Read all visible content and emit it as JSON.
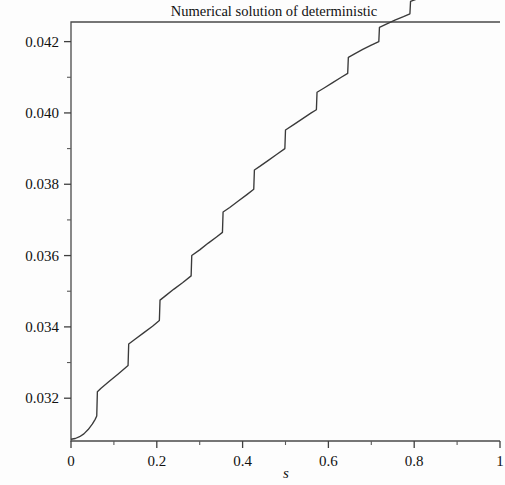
{
  "chart_data": {
    "type": "line",
    "title": "Numerical solution of deterministic",
    "xlabel": "s",
    "ylabel": "",
    "xlim": [
      0,
      1
    ],
    "ylim": [
      0.0308,
      0.04255
    ],
    "grid": false,
    "legend": null,
    "x_ticks": [
      {
        "value": 0,
        "label": "0"
      },
      {
        "value": 0.2,
        "label": "0.2"
      },
      {
        "value": 0.4,
        "label": "0.4"
      },
      {
        "value": 0.6,
        "label": "0.6"
      },
      {
        "value": 0.8,
        "label": "0.8"
      },
      {
        "value": 1,
        "label": "1"
      }
    ],
    "x_minor_ticks": [
      0.1,
      0.3,
      0.5,
      0.7,
      0.9
    ],
    "y_ticks": [
      {
        "value": 0.032,
        "label": "0.032"
      },
      {
        "value": 0.034,
        "label": "0.034"
      },
      {
        "value": 0.036,
        "label": "0.036"
      },
      {
        "value": 0.038,
        "label": "0.038"
      },
      {
        "value": 0.04,
        "label": "0.040"
      },
      {
        "value": 0.042,
        "label": "0.042"
      }
    ],
    "y_minor_ticks": [
      0.033,
      0.035,
      0.037,
      0.039,
      0.041
    ],
    "series": [
      {
        "name": "deterministic numerical solution",
        "description": "monotone increasing staircase: smooth concave rise then 13 vertical jumps with sloped risers, flattening near s=1",
        "points": [
          [
            0.0,
            0.03085
          ],
          [
            0.01,
            0.03087
          ],
          [
            0.02,
            0.03092
          ],
          [
            0.03,
            0.031
          ],
          [
            0.04,
            0.03112
          ],
          [
            0.05,
            0.03128
          ],
          [
            0.056,
            0.0314
          ],
          [
            0.06,
            0.0315
          ],
          [
            0.0615,
            0.03218
          ],
          [
            0.07,
            0.03228
          ],
          [
            0.09,
            0.03248
          ],
          [
            0.11,
            0.03268
          ],
          [
            0.133,
            0.03292
          ],
          [
            0.1345,
            0.03352
          ],
          [
            0.15,
            0.03366
          ],
          [
            0.17,
            0.03384
          ],
          [
            0.19,
            0.03402
          ],
          [
            0.206,
            0.03418
          ],
          [
            0.2075,
            0.03475
          ],
          [
            0.22,
            0.03487
          ],
          [
            0.24,
            0.03506
          ],
          [
            0.26,
            0.03524
          ],
          [
            0.28,
            0.03543
          ],
          [
            0.2815,
            0.036
          ],
          [
            0.3,
            0.03616
          ],
          [
            0.32,
            0.03635
          ],
          [
            0.34,
            0.03653
          ],
          [
            0.353,
            0.03665
          ],
          [
            0.3545,
            0.03722
          ],
          [
            0.37,
            0.03735
          ],
          [
            0.39,
            0.03753
          ],
          [
            0.41,
            0.03771
          ],
          [
            0.426,
            0.03786
          ],
          [
            0.4275,
            0.0384
          ],
          [
            0.44,
            0.0385
          ],
          [
            0.46,
            0.03867
          ],
          [
            0.48,
            0.03884
          ],
          [
            0.4985,
            0.039
          ],
          [
            0.5,
            0.03952
          ],
          [
            0.52,
            0.03968
          ],
          [
            0.54,
            0.03984
          ],
          [
            0.56,
            0.04
          ],
          [
            0.572,
            0.04009
          ],
          [
            0.5735,
            0.04058
          ],
          [
            0.59,
            0.0407
          ],
          [
            0.61,
            0.04085
          ],
          [
            0.63,
            0.041
          ],
          [
            0.645,
            0.04111
          ],
          [
            0.6465,
            0.04156
          ],
          [
            0.66,
            0.04165
          ],
          [
            0.68,
            0.04178
          ],
          [
            0.7,
            0.0419
          ],
          [
            0.7175,
            0.042
          ],
          [
            0.719,
            0.0424
          ],
          [
            0.735,
            0.04249
          ],
          [
            0.755,
            0.0426
          ],
          [
            0.775,
            0.0427
          ],
          [
            0.79,
            0.04278
          ],
          [
            0.7915,
            0.04313
          ],
          [
            0.81,
            0.04321
          ],
          [
            0.83,
            0.0433
          ],
          [
            0.85,
            0.04339
          ],
          [
            0.863,
            0.04344
          ],
          [
            0.8645,
            0.04374
          ],
          [
            0.88,
            0.0438
          ],
          [
            0.9,
            0.04387
          ],
          [
            0.92,
            0.04394
          ],
          [
            0.935,
            0.04398
          ],
          [
            0.9365,
            0.0442
          ],
          [
            0.95,
            0.04424
          ],
          [
            0.97,
            0.04429
          ],
          [
            0.99,
            0.04433
          ],
          [
            1.0,
            0.04435
          ]
        ]
      }
    ]
  },
  "figure": {
    "plot_left_px": 71,
    "plot_right_px": 500,
    "plot_top_px": 22,
    "plot_bottom_px": 441
  }
}
